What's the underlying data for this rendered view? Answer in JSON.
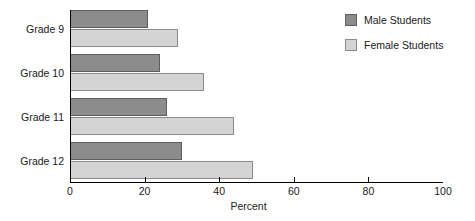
{
  "chart_data": {
    "type": "bar",
    "orientation": "horizontal",
    "title": "",
    "xlabel": "Percent",
    "ylabel": "",
    "categories": [
      "Grade 9",
      "Grade 10",
      "Grade 11",
      "Grade 12"
    ],
    "series": [
      {
        "name": "Male Students",
        "color": "#8c8c8c",
        "values": [
          21,
          24,
          26,
          30
        ]
      },
      {
        "name": "Female Students",
        "color": "#d4d4d4",
        "values": [
          29,
          36,
          44,
          49
        ]
      }
    ],
    "xlim": [
      0,
      100
    ],
    "xticks": [
      0,
      20,
      40,
      60,
      80,
      100
    ],
    "xtick_labels": [
      "0",
      "20",
      "40",
      "60",
      "80",
      "100"
    ],
    "grid": false,
    "legend_position": "top-right"
  },
  "legend": {
    "items": [
      {
        "label": "Male Students",
        "color": "#8c8c8c"
      },
      {
        "label": "Female Students",
        "color": "#d4d4d4"
      }
    ]
  },
  "axis": {
    "x_title": "Percent"
  }
}
